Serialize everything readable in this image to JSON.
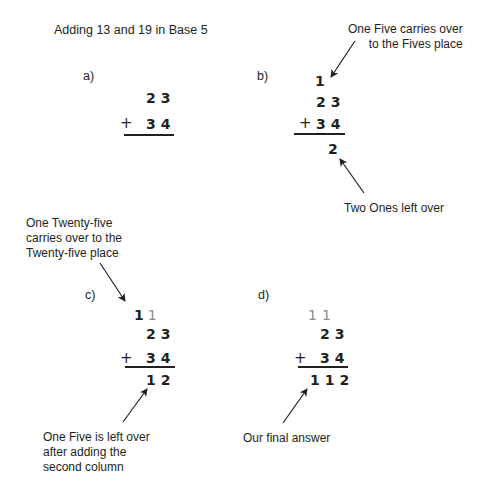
{
  "title": "Adding 13 and 19 in Base 5",
  "panels": {
    "a": {
      "label": "a)",
      "top": "23",
      "plus": "+",
      "bottom": "34"
    },
    "b": {
      "label": "b)",
      "carry": "1",
      "top": "23",
      "plus": "+",
      "bottom": "34",
      "result": "2",
      "note_top": [
        "One Five carries over",
        "to the Fives place"
      ],
      "note_bottom": "Two Ones left over"
    },
    "c": {
      "label": "c)",
      "carry_dark": "1",
      "carry_gray": "1",
      "top": "23",
      "plus": "+",
      "bottom": "34",
      "result": "12",
      "note_top": [
        "One Twenty-five",
        "carries over to the",
        "Twenty-five place"
      ],
      "note_bottom": [
        "One Five is left over",
        "after adding the",
        "second column"
      ]
    },
    "d": {
      "label": "d)",
      "carry": "11",
      "top": "23",
      "plus": "+",
      "bottom": "34",
      "result": "112",
      "note_bottom": "Our final answer"
    }
  },
  "colors": {
    "ink": "#231f20",
    "carry_gray": "#8a8a8a",
    "background": "#ffffff"
  }
}
